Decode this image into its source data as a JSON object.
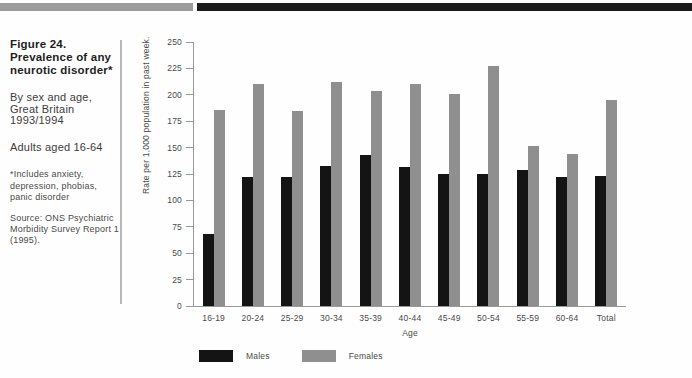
{
  "colors": {
    "males": "#141414",
    "females": "#8f8f8f",
    "header_gray": "#9b9b9b",
    "header_black": "#1b1b1b"
  },
  "sidebar": {
    "title_lines": [
      "Figure 24.",
      "Prevalence of any",
      "neurotic disorder*"
    ],
    "subtitle_lines": [
      "By sex and age,",
      "Great Britain",
      "1993/1994"
    ],
    "population": "Adults aged 16-64",
    "footnote_lines": [
      "*Includes anxiety,",
      "depression, phobias,",
      "panic disorder"
    ],
    "source_lines": [
      "Source: ONS Psychiatric",
      "Morbidity Survey Report 1",
      "(1995)."
    ]
  },
  "chart_data": {
    "type": "bar",
    "title": "Prevalence of any neurotic disorder",
    "categories": [
      "16-19",
      "20-24",
      "25-29",
      "30-34",
      "35-39",
      "40-44",
      "45-49",
      "50-54",
      "55-59",
      "60-64",
      "Total"
    ],
    "series": [
      {
        "name": "Males",
        "color": "#141414",
        "values": [
          68,
          122,
          122,
          133,
          143,
          132,
          125,
          125,
          129,
          122,
          123
        ]
      },
      {
        "name": "Females",
        "color": "#8f8f8f",
        "values": [
          186,
          210,
          185,
          212,
          204,
          210,
          201,
          227,
          152,
          144,
          195
        ]
      }
    ],
    "xlabel": "Age",
    "ylabel": "Rate per 1,000 population in past week.",
    "ylim": [
      0,
      250
    ],
    "yticks": [
      0,
      25,
      50,
      75,
      100,
      125,
      150,
      175,
      200,
      225,
      250
    ],
    "grid": false,
    "legend_position": "bottom"
  }
}
